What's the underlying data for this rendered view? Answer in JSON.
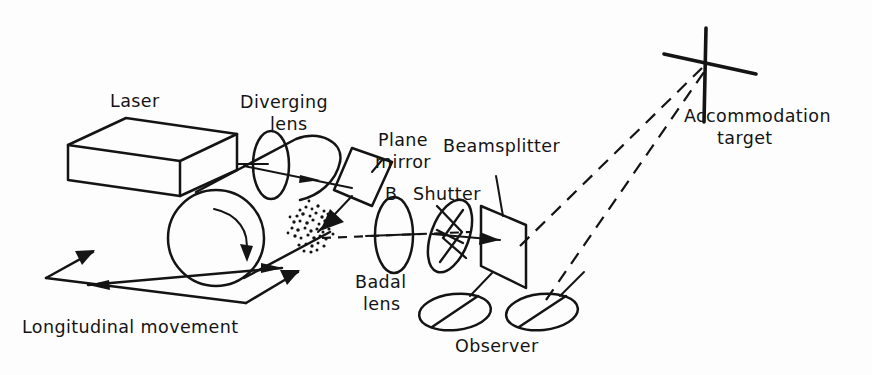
{
  "figure": {
    "background_color": "#fdfdfd",
    "ink_color": "#141414"
  },
  "labels": {
    "laser": "Laser",
    "diverging_lens_line1": "Diverging",
    "diverging_lens_line2": "lens",
    "plane_mirror_line1": "Plane",
    "plane_mirror_line2": "mirror",
    "badal_marker": "B",
    "shutter": "Shutter",
    "beamsplitter": "Beamsplitter",
    "badal_lens_line1": "Badal",
    "badal_lens_line2": "lens",
    "observer": "Observer",
    "accommodation_target_line1": "Accommodation",
    "accommodation_target_line2": "target",
    "longitudinal_movement": "Longitudinal movement"
  },
  "components": [
    {
      "name": "laser",
      "shape": "3d-box",
      "label": "Laser"
    },
    {
      "name": "diverging-lens",
      "shape": "vertical-ellipse",
      "label": "Diverging lens"
    },
    {
      "name": "rotating-drum",
      "shape": "cylinder",
      "label": "",
      "rotation_indicator": true
    },
    {
      "name": "speckle-pattern",
      "shape": "stipple-blob",
      "label": ""
    },
    {
      "name": "plane-mirror",
      "shape": "tilted-quadrilateral",
      "label": "Plane mirror"
    },
    {
      "name": "badal-lens",
      "shape": "vertical-ellipse",
      "label": "Badal lens"
    },
    {
      "name": "shutter",
      "shape": "iris-ellipse",
      "label": "Shutter"
    },
    {
      "name": "beamsplitter",
      "shape": "parallelogram-plate",
      "label": "Beamsplitter"
    },
    {
      "name": "observer-eye-left",
      "shape": "tilted-ellipse",
      "label": "Observer"
    },
    {
      "name": "observer-eye-right",
      "shape": "tilted-ellipse",
      "label": "Observer"
    },
    {
      "name": "accommodation-target",
      "shape": "cross",
      "label": "Accommodation target"
    },
    {
      "name": "longitudinal-movement-arrow",
      "shape": "double-headed-arrow",
      "label": "Longitudinal movement"
    }
  ]
}
